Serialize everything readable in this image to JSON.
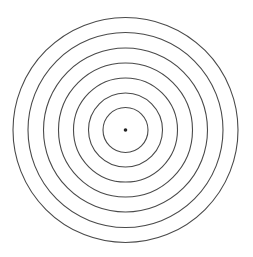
{
  "diagram": {
    "type": "concentric-circles",
    "center": {
      "x": 125.5,
      "y": 130
    },
    "ring_radii": [
      112.5,
      97.5,
      82,
      67,
      52,
      37,
      22.5
    ],
    "ring_count": 7,
    "stroke_color": "#4a4a4a",
    "stroke_width": 1.1,
    "center_dot": {
      "radius": 1.8,
      "color": "#222222"
    },
    "background": "#ffffff"
  }
}
